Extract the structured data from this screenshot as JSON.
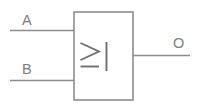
{
  "diagram": {
    "gate": {
      "symbol_label": "≥1",
      "symbol_parts": {
        "ge_sign": "≥",
        "one_digit": "1"
      },
      "function": "OR",
      "box": {
        "x": 74,
        "y": 12,
        "width": 59,
        "height": 88
      }
    },
    "inputs": [
      {
        "name": "input-a",
        "label": "A",
        "label_x": 22,
        "label_y": 25,
        "wire_y": 30.5,
        "wire_x_start": 10,
        "wire_x_end": 74
      },
      {
        "name": "input-b",
        "label": "B",
        "label_x": 22,
        "label_y": 74,
        "wire_y": 80.5,
        "wire_x_start": 10,
        "wire_x_end": 74
      }
    ],
    "outputs": [
      {
        "name": "output-o",
        "label": "O",
        "label_x": 173,
        "label_y": 48,
        "wire_y": 55.5,
        "wire_x_start": 133,
        "wire_x_end": 190
      }
    ],
    "colors": {
      "background": "#ffffff",
      "stroke": "#8d8d8d",
      "glyph": "#6f6f6f",
      "text": "#7e7e7e"
    }
  }
}
